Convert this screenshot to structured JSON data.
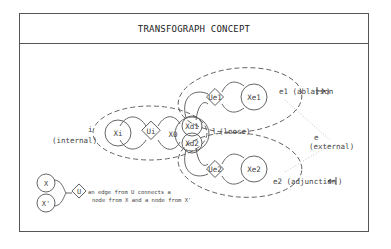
{
  "title": "TRANSFOGRAPH CONCEPT",
  "nodes": {
    "xi": "Xi",
    "ui": "Ui",
    "x0": "X0",
    "xd1": "Xd1",
    "xd2": "Xd2",
    "ue1": "Ue1",
    "xe1": "Xe1",
    "ue2": "Ue2",
    "xe2": "Xe2"
  },
  "labels": {
    "internal_letter": "i",
    "internal_text": "(internal)",
    "loose_letter": "l",
    "loose_text": "(loose)",
    "external_letter": "e",
    "external_text": "(external)",
    "e1_text": "e1 (ablation",
    "e1_end": ")",
    "e2_text": "e2 (adjunction",
    "e2_end": ")"
  },
  "legend": {
    "node_x": "X",
    "node_x_prime": "X'",
    "edge_u": "U",
    "line1": "an edge from U connects a",
    "line2": "node from X and a node from X'"
  },
  "colors": {
    "stroke": "#555555",
    "text": "#444444"
  }
}
